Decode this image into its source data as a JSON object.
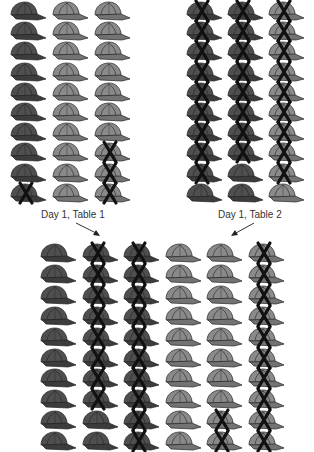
{
  "colors": {
    "dark_hat": "#4f4f4f",
    "dark_hat_shade": "#3c3c3c",
    "light_hat": "#8a8a8a",
    "light_hat_shade": "#737373",
    "outline": "#222222",
    "x_mark": "#111111",
    "label_text": "#333333"
  },
  "icons": {
    "hat": "baseball-cap-icon",
    "mark": "x-mark-icon",
    "arrow": "arrow-icon"
  },
  "labels": {
    "table1": "Day 1, Table 1",
    "table2": "Day 1, Table 2"
  },
  "grids": {
    "table1": {
      "rows": 10,
      "cols": 3,
      "column_shades": [
        "dark",
        "light",
        "light"
      ],
      "x_marks": [
        [
          0,
          0,
          0
        ],
        [
          0,
          0,
          0
        ],
        [
          0,
          0,
          0
        ],
        [
          0,
          0,
          0
        ],
        [
          0,
          0,
          0
        ],
        [
          0,
          0,
          0
        ],
        [
          0,
          0,
          0
        ],
        [
          0,
          0,
          1
        ],
        [
          0,
          0,
          1
        ],
        [
          1,
          0,
          1
        ]
      ]
    },
    "table2": {
      "rows": 10,
      "cols": 3,
      "column_shades": [
        "dark",
        "dark",
        "light"
      ],
      "x_marks": [
        [
          1,
          1,
          1
        ],
        [
          1,
          1,
          1
        ],
        [
          1,
          1,
          1
        ],
        [
          1,
          1,
          1
        ],
        [
          1,
          1,
          1
        ],
        [
          1,
          1,
          1
        ],
        [
          1,
          1,
          1
        ],
        [
          1,
          1,
          1
        ],
        [
          1,
          0,
          1
        ],
        [
          0,
          0,
          0
        ]
      ]
    },
    "combined": {
      "rows": 10,
      "cols": 6,
      "column_shades": [
        "dark",
        "dark",
        "dark",
        "light",
        "light",
        "light"
      ],
      "x_marks": [
        [
          0,
          1,
          1,
          0,
          0,
          1
        ],
        [
          0,
          1,
          1,
          0,
          0,
          1
        ],
        [
          0,
          1,
          1,
          0,
          0,
          1
        ],
        [
          0,
          1,
          1,
          0,
          0,
          1
        ],
        [
          0,
          1,
          1,
          0,
          0,
          1
        ],
        [
          0,
          1,
          1,
          0,
          0,
          1
        ],
        [
          0,
          1,
          1,
          0,
          0,
          1
        ],
        [
          0,
          1,
          1,
          0,
          0,
          1
        ],
        [
          0,
          0,
          1,
          0,
          1,
          1
        ],
        [
          0,
          0,
          1,
          0,
          1,
          1
        ]
      ]
    }
  }
}
